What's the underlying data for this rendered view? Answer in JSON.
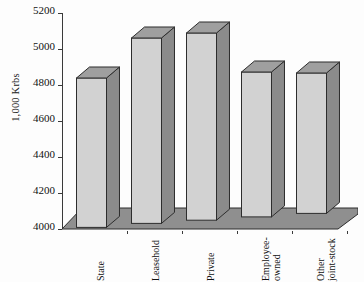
{
  "chart_data": {
    "type": "bar",
    "title": "",
    "subtitle": "",
    "xlabel": "",
    "ylabel": "1,000 Krbs",
    "categories": [
      "State",
      "Leasehold",
      "Private",
      "Employee-owned",
      "Other joint-stock"
    ],
    "category_lines": [
      [
        "State"
      ],
      [
        "Leasehold"
      ],
      [
        "Private"
      ],
      [
        "Employee-",
        "owned"
      ],
      [
        "Other",
        "joint-stock"
      ]
    ],
    "values": [
      4830,
      5030,
      5040,
      4805,
      4780
    ],
    "ylim": [
      4000,
      5200
    ],
    "yticks": [
      4000,
      4200,
      4400,
      4600,
      4800,
      5000,
      5200
    ],
    "ytick_labels": [
      "4000",
      "4200",
      "4400",
      "4600",
      "4800",
      "5000",
      "5200"
    ],
    "grid": false,
    "legend": null,
    "legend_position": "none",
    "style": "3d-column",
    "series": [
      {
        "name": "1,000 Krbs",
        "values": [
          4830,
          5030,
          5040,
          4805,
          4780
        ]
      }
    ]
  },
  "colors": {
    "bar_front": "#d2d2d2",
    "bar_side": "#8b8b8b",
    "bar_top": "#9f9f9f",
    "outline": "#2d2d2d",
    "floor": "#8f8f8f",
    "axis": "#3a3a3a",
    "background": "#fdfdfd",
    "text": "#111111"
  },
  "axis": {
    "y_title": "1,000 Krbs"
  }
}
